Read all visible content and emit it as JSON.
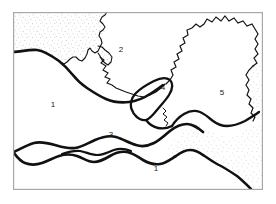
{
  "figure": {
    "type": "geological-sketch-map",
    "title": "",
    "background_color": "#ffffff",
    "frame": {
      "name": "map-border",
      "x": 13,
      "y": 12,
      "width": 250,
      "height": 178,
      "stroke_color": "#a8a8a8",
      "stroke_width": 1.2
    }
  },
  "style": {
    "boundary_thick_color": "#111111",
    "boundary_thick_width": 2.6,
    "boundary_thin_color": "#141414",
    "boundary_thin_width": 1.1,
    "stipple_color": "#8e8e8e",
    "label_color": "#1a1a1a",
    "label_font_size": 8
  },
  "labels": [
    {
      "id": "label-2",
      "text": "2",
      "x": 121,
      "y": 50
    },
    {
      "id": "label-1-left",
      "text": "1",
      "x": 53,
      "y": 105
    },
    {
      "id": "label-4",
      "text": "4",
      "x": 163,
      "y": 88
    },
    {
      "id": "label-5",
      "text": "5",
      "x": 222,
      "y": 93
    },
    {
      "id": "label-3",
      "text": "3",
      "x": 111,
      "y": 135
    },
    {
      "id": "label-1-bottom",
      "text": "1",
      "x": 156,
      "y": 169
    }
  ],
  "stipple_regions": [
    {
      "id": "stipple-northwest",
      "name": "upper-left-textured-unit",
      "density": 620
    },
    {
      "id": "stipple-east",
      "name": "right-textured-unit",
      "density": 430
    }
  ],
  "paths": {
    "upper_left_stipple_outline": "M 14,13 L 14,52 L 20,53 L 28,52 L 36,50 L 44,52 L 52,56 L 58,60 L 63,63 L 68,62 L 72,58 L 76,56 L 80,58 L 83,62 L 86,58 L 88,52 L 90,48 L 93,50 L 96,54 L 99,50 L 101,44 L 99,40 L 96,38 L 98,34 L 102,33 L 104,29 L 101,26 L 98,24 L 100,20 L 103,16 L 104,13 Z",
    "nw_jagged_edge": "M 104,13 L 103,17 L 100,20 L 98,24 L 101,26 L 104,29 L 102,33 L 98,34 L 96,38 L 99,40 L 101,44 L 99,50 L 96,54 L 93,50 L 90,48 L 88,52 L 86,58 L 83,62 L 80,58 L 76,56 L 72,58 L 68,62 L 63,63",
    "nw_peninsula": "M 99,50 L 104,52 L 109,55 L 112,60 L 110,64 L 106,62 L 103,58 L 100,56 L 98,52 Z",
    "main_upper_curve": "M 14,52 C 22,52 30,49 38,50 C 46,51 53,56 60,61 C 67,66 71,71 76,76 C 82,82 88,88 95,93 C 102,98 110,101 119,102 C 128,103 136,101 144,99 C 151,97 157,94 162,90",
    "crinkle_mid": "M 100,56 L 104,60 L 102,64 L 106,67 L 104,71 L 108,74 L 106,78 L 110,80 L 108,84 L 113,86 L 117,88 L 122,90 L 127,92 L 133,94 L 139,96 L 145,97 L 151,96 L 157,93 L 162,90",
    "region4_outline": "M 131,110 C 128,104 130,97 135,92 C 140,87 147,83 153,80 C 159,77 165,76 169,79 C 173,82 172,88 169,93 C 166,98 161,103 158,108 C 155,113 153,117 149,119 C 145,121 140,120 136,117 C 133,115 132,113 131,110 Z",
    "region5_west_edge": "M 169,79 L 172,74 L 176,70 L 174,66 L 178,62 L 176,57 L 181,54 L 179,49 L 184,46 L 182,41 L 187,38 L 186,33 L 191,31 L 195,27 L 199,30 L 203,27 L 207,22 L 212,24 L 216,20 L 221,23 L 225,19 L 229,23 L 234,21 L 238,25 L 243,23 L 247,27 L 251,26 L 255,30 L 258,35 L 256,40 L 259,45 L 256,50 L 259,55 L 255,58 L 258,63 L 254,66",
    "east_stipple_top": "M 254,66 L 250,70 L 247,75 L 250,79 L 247,84 L 250,89 L 248,94 L 252,98 L 250,103 L 254,107 L 252,112 L 256,116 L 254,121",
    "lower_thick_band_top": "M 14,152 C 20,150 26,146 33,144 C 40,142 47,143 53,145 C 60,147 66,149 73,148 C 80,147 86,143 93,140 C 100,137 107,135 114,136 C 121,137 127,141 133,143 C 139,145 145,145 151,142 C 157,139 162,134 167,130 C 172,126 177,123 183,123 C 189,123 195,126 200,130 C 206,134 212,137 219,137 C 226,137 232,134 238,131 C 244,128 249,124 255,121",
    "lower_thick_band_bottom": "M 14,162 C 20,164 27,166 34,165 C 41,164 47,160 54,158 C 61,156 68,156 74,158 C 80,160 85,163 91,163 C 97,163 102,160 107,157 C 112,154 117,152 123,152 C 129,152 134,155 139,158 C 144,161 149,163 155,163 C 161,163 166,160 171,156 C 176,152 181,149 187,148 C 193,147 199,149 204,152",
    "region3_inner": "M 60,156 C 66,154 72,152 78,153 C 84,154 89,157 95,157 C 101,157 106,154 112,152 C 118,150 124,150 129,152",
    "east_lower_boundary": "M 204,152 C 209,155 214,159 220,162 C 226,165 232,168 238,172 C 244,176 249,181 254,186",
    "mid_east_link": "M 183,123 C 186,118 190,114 194,111 C 198,108 203,106 208,107 C 213,108 217,112 220,116 C 223,120 226,123 230,124",
    "region5_south": "M 230,124 C 235,125 240,124 245,122 C 250,120 254,117 258,114"
  }
}
